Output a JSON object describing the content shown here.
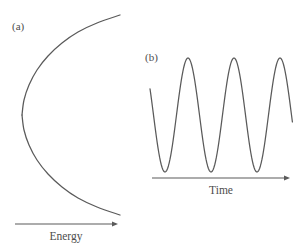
{
  "figure": {
    "width": 303,
    "height": 246,
    "background_color": "#ffffff",
    "stroke_color": "#5a5a5a",
    "text_color": "#4d4d4d"
  },
  "panels": [
    {
      "id": "a",
      "label": "(a)",
      "label_x": 12,
      "label_y": 30,
      "axis": {
        "label": "Energy",
        "label_x": 66,
        "label_y": 240,
        "x_start": 15,
        "x_end": 118,
        "y": 224,
        "direction": "right"
      }
    },
    {
      "id": "b",
      "label": "(b)",
      "label_x": 145,
      "label_y": 61,
      "axis": {
        "label": "Time",
        "label_x": 221,
        "label_y": 194,
        "x_start": 152,
        "x_end": 290,
        "y": 178,
        "direction": "right"
      }
    }
  ],
  "chart_data": [
    {
      "type": "line",
      "panel": "a",
      "title": "(a)",
      "xlabel": "Energy",
      "ylabel": "",
      "curve_shape": "rightward-opening-parabola",
      "grid": false,
      "legend": "none",
      "axis_arrow": "right",
      "vertex": [
        22,
        115
      ],
      "xlim": [
        15,
        130
      ],
      "ylim": [
        10,
        225
      ],
      "x": [
        22,
        24,
        29,
        37,
        48,
        62,
        78,
        97,
        120,
        24,
        29,
        37,
        48,
        62,
        78,
        97,
        120
      ],
      "y": [
        115,
        100,
        85,
        70,
        56,
        43,
        32,
        23,
        15,
        130,
        145,
        160,
        174,
        187,
        198,
        207,
        215
      ],
      "points_upper": [
        [
          22,
          115
        ],
        [
          24,
          100
        ],
        [
          29,
          85
        ],
        [
          37,
          70
        ],
        [
          48,
          56
        ],
        [
          62,
          43
        ],
        [
          78,
          32
        ],
        [
          97,
          23
        ],
        [
          120,
          15
        ]
      ],
      "points_lower": [
        [
          22,
          115
        ],
        [
          24,
          130
        ],
        [
          29,
          145
        ],
        [
          37,
          160
        ],
        [
          48,
          174
        ],
        [
          62,
          187
        ],
        [
          78,
          198
        ],
        [
          97,
          207
        ],
        [
          120,
          215
        ]
      ]
    },
    {
      "type": "line",
      "panel": "b",
      "title": "(b)",
      "xlabel": "Time",
      "ylabel": "",
      "curve_shape": "sinusoid",
      "grid": false,
      "legend": "none",
      "axis_arrow": "right",
      "amplitude": 57,
      "period": 46,
      "midline_y": 115,
      "peak_y": 58,
      "trough_y": 172,
      "cycles": 3.1,
      "xlim": [
        150,
        293
      ],
      "ylim": [
        55,
        178
      ],
      "x_start": 150,
      "x_end": 293,
      "peaks_x": [
        188,
        234,
        278
      ],
      "troughs_x": [
        165,
        211,
        257
      ],
      "start_point": [
        150,
        80
      ],
      "end_point": [
        293,
        118
      ]
    }
  ]
}
